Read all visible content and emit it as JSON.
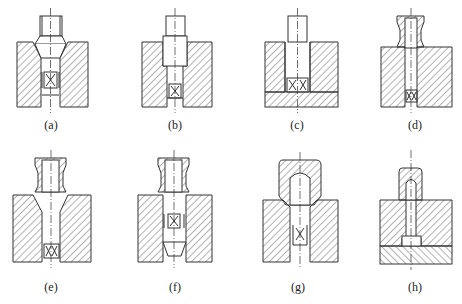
{
  "figure": {
    "panels": [
      {
        "id": "a",
        "label": "(a)",
        "feature": "stud with conical seat and pin-mark insert"
      },
      {
        "id": "b",
        "label": "(b)",
        "feature": "stud with shoulder seat and small insert at bottom"
      },
      {
        "id": "c",
        "label": "(c)",
        "feature": "stud bottoming on insert over base plate"
      },
      {
        "id": "d",
        "label": "(d)",
        "feature": "threaded sleeve collar above block with insert"
      },
      {
        "id": "e",
        "label": "(e)",
        "feature": "threaded sleeve over conical hole with insert"
      },
      {
        "id": "f",
        "label": "(f)",
        "feature": "threaded sleeve with mid insert and tapered plug"
      },
      {
        "id": "g",
        "label": "(g)",
        "feature": "cap nut over stud with U-shaped insert"
      },
      {
        "id": "h",
        "label": "(h)",
        "feature": "cap nut over bolt head seated in two-layer plate"
      }
    ]
  },
  "colors": {
    "line": "#333333",
    "hatch": "#555555",
    "background": "#ffffff"
  }
}
